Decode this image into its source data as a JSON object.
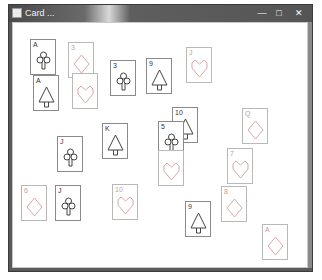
{
  "window": {
    "title": "Card ...",
    "controls": {
      "minimize": "—",
      "maximize": "□",
      "close": "✕"
    }
  },
  "colors": {
    "red_suit": "#d9a7a7",
    "black_suit": "#444444",
    "card_border": "#8a8a8a"
  },
  "cards": [
    {
      "rank": "A",
      "suit": "club",
      "color": "black",
      "x": 30,
      "y": 39
    },
    {
      "rank": "A",
      "suit": "spade",
      "color": "black",
      "x": 33,
      "y": 75
    },
    {
      "rank": "3",
      "suit": "diamond",
      "color": "red",
      "x": 68,
      "y": 42
    },
    {
      "rank": "",
      "suit": "heart",
      "color": "red",
      "x": 72,
      "y": 73
    },
    {
      "rank": "3",
      "suit": "club",
      "color": "black",
      "x": 110,
      "y": 60
    },
    {
      "rank": "9",
      "suit": "spade",
      "color": "black",
      "x": 146,
      "y": 58
    },
    {
      "rank": "J",
      "suit": "heart",
      "color": "red",
      "x": 186,
      "y": 47
    },
    {
      "rank": "10",
      "suit": "spade",
      "color": "black",
      "x": 172,
      "y": 107
    },
    {
      "rank": "5",
      "suit": "club",
      "color": "black",
      "x": 158,
      "y": 121
    },
    {
      "rank": "",
      "suit": "heart",
      "color": "red",
      "x": 158,
      "y": 150
    },
    {
      "rank": "Q",
      "suit": "diamond",
      "color": "red",
      "x": 242,
      "y": 108
    },
    {
      "rank": "J",
      "suit": "club",
      "color": "black",
      "x": 57,
      "y": 136
    },
    {
      "rank": "K",
      "suit": "spade",
      "color": "black",
      "x": 102,
      "y": 123
    },
    {
      "rank": "7",
      "suit": "heart",
      "color": "red",
      "x": 227,
      "y": 148
    },
    {
      "rank": "6",
      "suit": "diamond",
      "color": "red",
      "x": 21,
      "y": 185
    },
    {
      "rank": "J",
      "suit": "club",
      "color": "black",
      "x": 55,
      "y": 185
    },
    {
      "rank": "10",
      "suit": "heart",
      "color": "red",
      "x": 112,
      "y": 184
    },
    {
      "rank": "8",
      "suit": "diamond",
      "color": "red",
      "x": 221,
      "y": 186
    },
    {
      "rank": "9",
      "suit": "spade",
      "color": "black",
      "x": 185,
      "y": 201
    },
    {
      "rank": "A",
      "suit": "diamond",
      "color": "red",
      "x": 262,
      "y": 224
    }
  ]
}
